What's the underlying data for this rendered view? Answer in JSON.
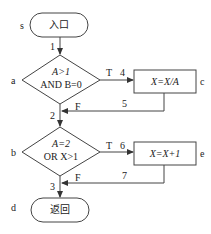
{
  "diagram": {
    "type": "flowchart",
    "nodes": {
      "start": {
        "id": "s",
        "text": "入口",
        "shape": "terminal"
      },
      "a": {
        "id": "a",
        "line1": "A>1",
        "line2": "AND B=0",
        "shape": "decision"
      },
      "c": {
        "id": "c",
        "text": "X=X/A",
        "shape": "process"
      },
      "b": {
        "id": "b",
        "line1": "A=2",
        "line2": "OR X>1",
        "shape": "decision"
      },
      "e": {
        "id": "e",
        "text": "X=X+1",
        "shape": "process"
      },
      "end": {
        "id": "d",
        "text": "返回",
        "shape": "terminal"
      }
    },
    "edges": {
      "e1": "1",
      "e2": "2",
      "e3": "3",
      "e4": "4",
      "e5": "5",
      "e6": "6",
      "e7": "7"
    },
    "branch_labels": {
      "a_true": "T",
      "a_false": "F",
      "b_true": "T",
      "b_false": "F"
    },
    "colors": {
      "stroke": "#333333",
      "text": "#222222",
      "background": "#ffffff"
    }
  }
}
